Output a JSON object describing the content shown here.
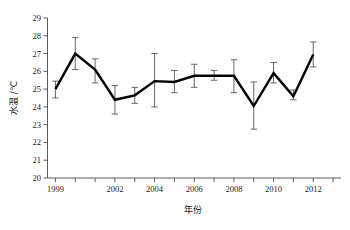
{
  "figure": {
    "title_fragment": "",
    "background_color": "#ffffff",
    "line_color": "#000000",
    "error_bar_color": "#555555",
    "axis_color": "#4a4a4a"
  },
  "axes": {
    "y_title": "水温 /℃",
    "x_title": "年份",
    "y_ticks": [
      "29",
      "28",
      "27",
      "26",
      "25",
      "24",
      "23",
      "22",
      "21",
      "20"
    ],
    "x_ticks": [
      "1999",
      "2002",
      "2004",
      "2006",
      "2008",
      "2010",
      "2012"
    ]
  },
  "chart_data": {
    "type": "line",
    "title": "",
    "xlabel": "年份",
    "ylabel": "水温 /℃",
    "xlim": [
      1998.6,
      2013.4
    ],
    "ylim": [
      20,
      29
    ],
    "grid": false,
    "legend": "none",
    "error_bars": "symmetric-vertical",
    "x": [
      1999,
      2000,
      2001,
      2002,
      2003,
      2004,
      2005,
      2006,
      2007,
      2008,
      2009,
      2010,
      2011,
      2012,
      2013
    ],
    "x_tick_values": [
      1999,
      2002,
      2004,
      2006,
      2008,
      2010,
      2012
    ],
    "series": [
      {
        "name": "水温",
        "values": [
          25.0,
          27.0,
          26.1,
          24.4,
          24.65,
          25.45,
          25.4,
          25.75,
          25.75,
          25.75,
          24.05,
          25.9,
          24.6,
          26.95,
          25.0
        ],
        "errors_low": [
          24.5,
          26.1,
          25.35,
          23.6,
          24.2,
          24.0,
          24.8,
          25.1,
          25.5,
          24.8,
          22.75,
          25.35,
          24.4,
          26.25,
          24.5
        ],
        "errors_high": [
          25.45,
          27.9,
          26.7,
          25.2,
          25.1,
          27.0,
          26.05,
          26.4,
          26.05,
          26.65,
          25.4,
          26.5,
          24.95,
          27.65,
          25.45
        ]
      }
    ]
  },
  "points": [
    {
      "year": 1999,
      "value": 25.0,
      "low": 24.5,
      "high": 25.45
    },
    {
      "year": 2000,
      "value": 27.0,
      "low": 26.1,
      "high": 27.9
    },
    {
      "year": 2001,
      "value": 26.1,
      "low": 25.35,
      "high": 26.7
    },
    {
      "year": 2002,
      "value": 24.4,
      "low": 23.6,
      "high": 25.2
    },
    {
      "year": 2003,
      "value": 24.65,
      "low": 24.2,
      "high": 25.1
    },
    {
      "year": 2004,
      "value": 25.45,
      "low": 24.0,
      "high": 27.0
    },
    {
      "year": 2005,
      "value": 25.4,
      "low": 24.8,
      "high": 26.05
    },
    {
      "year": 2006,
      "value": 25.75,
      "low": 25.1,
      "high": 26.4
    },
    {
      "year": 2007,
      "value": 25.75,
      "low": 25.5,
      "high": 26.05
    },
    {
      "year": 2008,
      "value": 25.75,
      "low": 24.8,
      "high": 26.65
    },
    {
      "year": 2009,
      "value": 24.05,
      "low": 22.75,
      "high": 25.4
    },
    {
      "year": 2010,
      "value": 25.9,
      "low": 25.35,
      "high": 26.5
    },
    {
      "year": 2011,
      "value": 24.6,
      "low": 24.4,
      "high": 24.95
    },
    {
      "year": 2012,
      "value": 26.95,
      "low": 26.25,
      "high": 27.65
    }
  ]
}
